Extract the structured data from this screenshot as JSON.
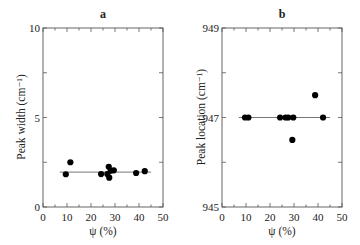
{
  "chart_data": [
    {
      "type": "scatter",
      "title": "a",
      "xlabel": "ψ (%)",
      "ylabel": "Peak width (cm⁻¹)",
      "xlim": [
        0,
        50
      ],
      "ylim": [
        0,
        10
      ],
      "xticks": [
        0,
        10,
        20,
        30,
        40,
        50
      ],
      "xtick_labels": [
        "0",
        "10",
        "20",
        "30",
        "40",
        "50"
      ],
      "yticks": [
        0,
        5,
        10
      ],
      "ytick_labels": [
        "0",
        "5",
        "10"
      ],
      "grid": false,
      "points": [
        {
          "x": 9.5,
          "y": 1.83
        },
        {
          "x": 11.4,
          "y": 2.5
        },
        {
          "x": 24.2,
          "y": 1.84
        },
        {
          "x": 26.8,
          "y": 1.84
        },
        {
          "x": 27.4,
          "y": 2.25
        },
        {
          "x": 27.6,
          "y": 1.64
        },
        {
          "x": 28.2,
          "y": 2.03
        },
        {
          "x": 29.5,
          "y": 2.05
        },
        {
          "x": 38.8,
          "y": 1.9
        },
        {
          "x": 42.4,
          "y": 2.0
        }
      ],
      "fit_line": {
        "x": [
          7,
          45
        ],
        "y": [
          1.95,
          1.95
        ]
      }
    },
    {
      "type": "scatter",
      "title": "b",
      "xlabel": "ψ (%)",
      "ylabel": "Peak location (cm⁻¹)",
      "xlim": [
        0,
        50
      ],
      "ylim": [
        945,
        949
      ],
      "xticks": [
        0,
        10,
        20,
        30,
        40,
        50
      ],
      "xtick_labels": [
        "0",
        "10",
        "20",
        "30",
        "40",
        "50"
      ],
      "yticks": [
        945,
        947,
        949
      ],
      "ytick_labels": [
        "945",
        "947",
        "949"
      ],
      "grid": false,
      "points": [
        {
          "x": 9.6,
          "y": 947.0
        },
        {
          "x": 11.0,
          "y": 947.0
        },
        {
          "x": 24.2,
          "y": 947.0
        },
        {
          "x": 26.5,
          "y": 947.0
        },
        {
          "x": 27.6,
          "y": 947.0
        },
        {
          "x": 29.7,
          "y": 947.0
        },
        {
          "x": 29.3,
          "y": 946.5
        },
        {
          "x": 38.8,
          "y": 947.5
        },
        {
          "x": 42.1,
          "y": 947.0
        }
      ],
      "fit_line": {
        "x": [
          7,
          45
        ],
        "y": [
          947.0,
          947.0
        ]
      }
    }
  ]
}
